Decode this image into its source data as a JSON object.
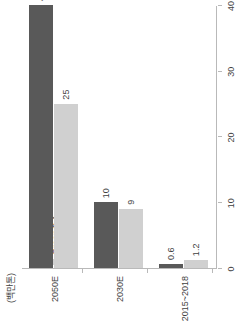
{
  "chart_data": {
    "type": "bar",
    "orientation": "horizontal",
    "title": "",
    "subtitle": "",
    "unit_label": "(백만톤)",
    "xlabel": "",
    "ylabel": "",
    "categories": [
      "2015~2018",
      "2030E",
      "2050E"
    ],
    "series": [
      {
        "name": "Blue수소",
        "color": "#595959",
        "values": [
          0.6,
          10,
          40
        ],
        "labels": [
          "0.6",
          "10",
          "40"
        ]
      },
      {
        "name": "Green수소",
        "color": "#d0d0d0",
        "values": [
          1.2,
          9,
          25
        ],
        "labels": [
          "1.2",
          "9",
          "25"
        ]
      }
    ],
    "value_axis": {
      "min": 0,
      "max": 40,
      "ticks": [
        0,
        10,
        20,
        30,
        40
      ],
      "tick_labels": [
        "0",
        "10",
        "20",
        "30",
        "40"
      ]
    },
    "grid": false,
    "legend_position": "top-left",
    "axis_color": "#b9b9b9",
    "text_color": "#3f3f3f",
    "background": "#ffffff"
  }
}
